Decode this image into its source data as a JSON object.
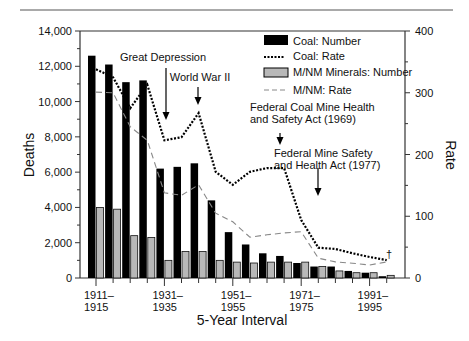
{
  "chart_data": {
    "type": "bar",
    "title": "",
    "xlabel": "5-Year Interval",
    "ylabel": "Deaths",
    "y2label": "Rate",
    "ylim": [
      0,
      14000
    ],
    "y2lim": [
      0,
      400
    ],
    "grid": false,
    "legend_position": "upper right (inside)",
    "left_ticks": [
      "0",
      "2,000",
      "4,000",
      "6,000",
      "8,000",
      "10,000",
      "12,000",
      "14,000"
    ],
    "right_ticks": [
      "0",
      "100",
      "200",
      "300",
      "400"
    ],
    "categories": [
      "1911–1915",
      "1916–1920",
      "1921–1925",
      "1926–1930",
      "1931–1935",
      "1936–1940",
      "1941–1945",
      "1946–1950",
      "1951–1955",
      "1956–1960",
      "1961–1965",
      "1966–1970",
      "1971–1975",
      "1976–1980",
      "1981–1985",
      "1986–1990",
      "1991–1995",
      "1996–2000"
    ],
    "x_tick_labels": [
      {
        "index": 0,
        "line1": "1911–",
        "line2": "1915"
      },
      {
        "index": 4,
        "line1": "1931–",
        "line2": "1935"
      },
      {
        "index": 8,
        "line1": "1951–",
        "line2": "1955"
      },
      {
        "index": 12,
        "line1": "1971–",
        "line2": "1975"
      },
      {
        "index": 16,
        "line1": "1991–",
        "line2": "1995"
      }
    ],
    "series": [
      {
        "name": "Coal: Number",
        "kind": "bar",
        "axis": "left",
        "color": "#000000",
        "values": [
          12600,
          12100,
          11100,
          11200,
          6200,
          6300,
          6500,
          4400,
          2600,
          1900,
          1400,
          1250,
          850,
          650,
          650,
          400,
          300,
          100
        ]
      },
      {
        "name": "Coal: Rate",
        "kind": "line",
        "style": "dotted",
        "axis": "right",
        "color": "#000000",
        "values": [
          338,
          325,
          275,
          313,
          223,
          228,
          267,
          172,
          151,
          172,
          178,
          178,
          94,
          49,
          47,
          40,
          34,
          29
        ]
      },
      {
        "name": "M/NM Minerals: Number",
        "kind": "bar",
        "axis": "left",
        "color": "#b8b8b8",
        "values": [
          4000,
          3900,
          2400,
          2300,
          1000,
          1500,
          1500,
          1000,
          900,
          850,
          900,
          900,
          900,
          650,
          400,
          300,
          300,
          150
        ]
      },
      {
        "name": "M/NM: Rate",
        "kind": "line",
        "style": "dashed",
        "axis": "right",
        "color": "#888888",
        "values": [
          301,
          300,
          245,
          223,
          138,
          134,
          151,
          105,
          91,
          66,
          70,
          73,
          75,
          32,
          26,
          24,
          21,
          26
        ]
      }
    ],
    "annotations": [
      {
        "lines": [
          "Great Depression"
        ],
        "x_index": 4.2,
        "text_x": 163,
        "text_y": 61,
        "arrow_x": 166,
        "arrow_from": 68,
        "arrow_to": 120
      },
      {
        "lines": [
          "World War II"
        ],
        "x_index": 6,
        "text_x": 200,
        "text_y": 81,
        "arrow_x": 198,
        "arrow_from": 87,
        "arrow_to": 105
      },
      {
        "lines": [
          "Federal Coal Mine Health",
          "and Safety Act (1969)"
        ],
        "x_index": 11.5,
        "text_x": 250,
        "text_y": 111,
        "arrow_x": 280,
        "arrow_from": 133,
        "arrow_to": 145
      },
      {
        "lines": [
          "Federal Mine Safety",
          "and Health Act (1977)"
        ],
        "x_index": 13.7,
        "text_x": 274,
        "text_y": 157,
        "arrow_x": 318,
        "arrow_from": 168,
        "arrow_to": 196
      }
    ],
    "footnote_marker": "†"
  }
}
